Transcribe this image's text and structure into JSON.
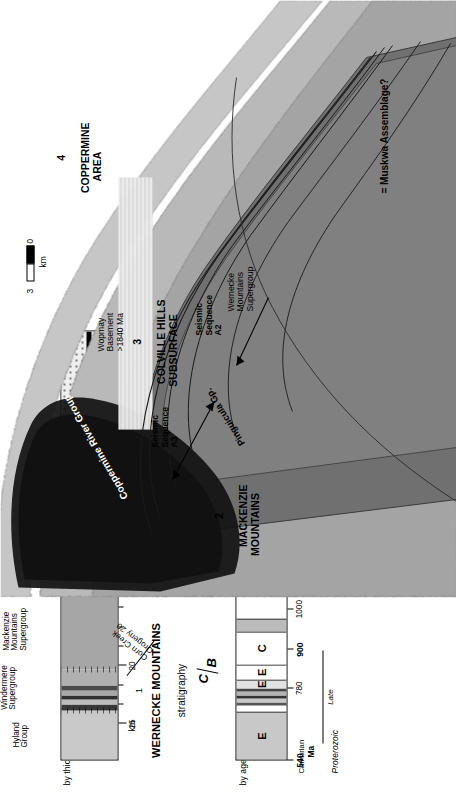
{
  "figure": {
    "kind": "geological-cross-section",
    "orientation": "rotated-90-ccw"
  },
  "panel1": {
    "number": "1",
    "title": "WERNECKE MOUNTAINS",
    "subtitle": "stratigraphy",
    "age_column_label": "by age",
    "thickness_column_label": "by thickness",
    "age_axis": {
      "unit": "Ma",
      "ticks": [
        {
          "label": "540",
          "bold": true,
          "pos": 0.0
        },
        {
          "label": "780",
          "bold": false,
          "pos": 0.168
        },
        {
          "label": "900",
          "bold": true,
          "pos": 0.258
        },
        {
          "label": "1000",
          "bold": false,
          "pos": 0.352
        },
        {
          "label": "1100",
          "bold": false,
          "pos": 0.443
        },
        {
          "label": "1200",
          "bold": false,
          "pos": 0.533
        },
        {
          "label": "1270",
          "bold": false,
          "pos": 0.594
        },
        {
          "label": "1380",
          "bold": false,
          "pos": 0.676
        },
        {
          "label": "1600",
          "bold": true,
          "pos": 0.84
        },
        {
          "label": "1710",
          "bold": false,
          "pos": 0.932
        }
      ],
      "ma_suffix": "Ma",
      "cambrian_label": "Cambrian",
      "eras": [
        {
          "label": "Late",
          "start": 0.04,
          "end": 0.255
        },
        {
          "label": "Middle",
          "start": 0.49,
          "end": 0.7
        },
        {
          "label": "Early",
          "start": 0.905,
          "end": 1.0
        }
      ],
      "system_label": "Proterozoic"
    },
    "age_cells": [
      {
        "name": "hyland",
        "start": 0.0,
        "end": 0.112,
        "fill": "#c8c8c8",
        "letter": "E"
      },
      {
        "name": "windermere-upper",
        "start": 0.112,
        "end": 0.125,
        "fill": "#ffffff",
        "letter": ""
      },
      {
        "name": "windermere-a",
        "start": 0.125,
        "end": 0.134,
        "fill": "#555555",
        "letter": ""
      },
      {
        "name": "windermere-b",
        "start": 0.134,
        "end": 0.143,
        "fill": "#c8c8c8",
        "letter": ""
      },
      {
        "name": "windermere-c",
        "start": 0.143,
        "end": 0.15,
        "fill": "#333333",
        "letter": ""
      },
      {
        "name": "windermere-d",
        "start": 0.15,
        "end": 0.158,
        "fill": "#b4b4b4",
        "letter": ""
      },
      {
        "name": "windermere-e",
        "start": 0.158,
        "end": 0.166,
        "fill": "#444444",
        "letter": ""
      },
      {
        "name": "windermere-f",
        "start": 0.166,
        "end": 0.188,
        "fill": "#e2e2e2",
        "letter": "E"
      },
      {
        "name": "gap-780",
        "start": 0.188,
        "end": 0.222,
        "fill": "#ffffff",
        "letter": "E"
      },
      {
        "name": "pinguicula-gap",
        "start": 0.222,
        "end": 0.3,
        "fill": "#ffffff",
        "letter": "C"
      },
      {
        "name": "pinguicula-a",
        "start": 0.3,
        "end": 0.33,
        "fill": "#bbbbbb",
        "letter": ""
      },
      {
        "name": "mackenzie-mtns",
        "start": 0.33,
        "end": 0.64,
        "fill": "#ffffff",
        "letter": "E"
      },
      {
        "name": "unit-1380",
        "start": 0.64,
        "end": 0.705,
        "fill": "#606060",
        "letter": "E"
      },
      {
        "name": "gap-1600",
        "start": 0.705,
        "end": 0.905,
        "fill": "#ffffff",
        "letter": "C"
      },
      {
        "name": "wernecke-sg-1",
        "start": 0.905,
        "end": 0.945,
        "fill": "#ffffff",
        "letter": "E"
      },
      {
        "name": "wernecke-sg-2",
        "start": 0.945,
        "end": 1.0,
        "fill": "#ededed",
        "letter": "E"
      }
    ],
    "thickness_axis": {
      "unit": "km",
      "unit_label": "km",
      "ticks": [
        {
          "label": "25",
          "pos": 0.085,
          "major": true
        },
        {
          "label": "",
          "pos": 0.13,
          "major": false
        },
        {
          "label": "",
          "pos": 0.175,
          "major": false
        },
        {
          "label": "20",
          "pos": 0.22,
          "major": true
        },
        {
          "label": "",
          "pos": 0.265,
          "major": false
        },
        {
          "label": "",
          "pos": 0.31,
          "major": false
        },
        {
          "label": "",
          "pos": 0.355,
          "major": false
        },
        {
          "label": "15",
          "pos": 0.4,
          "major": true
        },
        {
          "label": "",
          "pos": 0.445,
          "major": false
        },
        {
          "label": "",
          "pos": 0.49,
          "major": false
        },
        {
          "label": "",
          "pos": 0.535,
          "major": false
        },
        {
          "label": "10",
          "pos": 0.58,
          "major": true
        },
        {
          "label": "",
          "pos": 0.625,
          "major": false
        },
        {
          "label": "",
          "pos": 0.67,
          "major": false
        },
        {
          "label": "",
          "pos": 0.715,
          "major": false
        },
        {
          "label": "5",
          "pos": 0.76,
          "major": true
        },
        {
          "label": "",
          "pos": 0.805,
          "major": false
        },
        {
          "label": "",
          "pos": 0.85,
          "major": false
        },
        {
          "label": "",
          "pos": 0.895,
          "major": false
        },
        {
          "label": "0",
          "pos": 0.955,
          "major": true
        }
      ]
    },
    "thickness_cells": [
      {
        "name": "hyland-group",
        "start": 0.0,
        "end": 0.115,
        "fill": "#c9c9c9"
      },
      {
        "name": "windermere-band-1",
        "start": 0.115,
        "end": 0.128,
        "fill": "#3a3a3a"
      },
      {
        "name": "windermere-band-2",
        "start": 0.128,
        "end": 0.14,
        "fill": "#bdbdbd"
      },
      {
        "name": "windermere-band-3",
        "start": 0.14,
        "end": 0.15,
        "fill": "#2e2e2e"
      },
      {
        "name": "windermere-band-4",
        "start": 0.15,
        "end": 0.162,
        "fill": "#a8a8a8"
      },
      {
        "name": "windermere-band-5",
        "start": 0.162,
        "end": 0.172,
        "fill": "#4a4a4a"
      },
      {
        "name": "windermere-supergroup",
        "start": 0.172,
        "end": 0.21,
        "fill": "#b0b0b0"
      },
      {
        "name": "mackenzie-mtns-supergroup",
        "start": 0.21,
        "end": 0.43,
        "fill": "#a6a6a6"
      },
      {
        "name": "pinguicula-group",
        "start": 0.43,
        "end": 0.57,
        "fill": "#6e6e6e"
      },
      {
        "name": "wernecke-breccia-zone",
        "start": 0.57,
        "end": 0.7,
        "fill": "#7a7a7a"
      },
      {
        "name": "wernecke-supergroup-upper",
        "start": 0.7,
        "end": 0.84,
        "fill": "#e8e8e8"
      },
      {
        "name": "wernecke-supergroup-lower",
        "start": 0.84,
        "end": 1.0,
        "fill": "#f0f0f0"
      }
    ],
    "group_labels": [
      {
        "name": "hyland-group",
        "text": "Hyland\nGroup",
        "x": 0.03,
        "y": 12
      },
      {
        "name": "windermere-supergroup",
        "text": "Windermere\nSupergroup",
        "x": 0.118,
        "y": 0
      },
      {
        "name": "mackenzie-mountains-supergroup",
        "text": "Mackenzie\nMountains\nSupergroup",
        "x": 0.255,
        "y": 2
      },
      {
        "name": "pinguicula-group",
        "text": "Pinguicula\nGroup",
        "x": 0.455,
        "y": 4
      },
      {
        "name": "wernecke-supergroup",
        "text": "Wernecke\nSupergroup",
        "x": 0.705,
        "y": 18
      }
    ],
    "annotations": {
      "corn_creek_orogeny": "Corn Creek\nOrogeny 20",
      "racklan_orogeny": "Racklan Orogeny",
      "wernecke_breccia": "Wernecke\nBreccia",
      "seq_c_upper": "C",
      "seq_b_upper": "B",
      "seq_b_mid": "B",
      "seq_a_mid": "A"
    }
  },
  "cross_section": {
    "sections": [
      {
        "num": "2",
        "title": "MACKENZIE\nMOUNTAINS"
      },
      {
        "num": "3",
        "title": "COLVILLE HILLS\nSUBSURFACE"
      },
      {
        "num": "4",
        "title": "COPPERMINE\nAREA"
      }
    ],
    "labels": [
      {
        "name": "coppermine-river-group",
        "text": "Coppermine River Group",
        "white": true
      },
      {
        "name": "wopmay-basement",
        "text": "Wopmay\nBasement\n>1840 Ma",
        "white": false
      },
      {
        "name": "pinguicula-gp",
        "text": "Pinguicula Gp.",
        "white": false
      },
      {
        "name": "wernecke-mountains-supergroup",
        "text": "Wernecke\nMountains\nSupergroup",
        "white": false
      },
      {
        "name": "seismic-sequence-a3",
        "text": "Seismic\nSequence\nA3",
        "white": false
      },
      {
        "name": "seismic-sequence-a2",
        "text": "Seismic\nSequence\nA2",
        "white": false
      },
      {
        "name": "muskwa-assemblage",
        "text": "= Muskwa Assemblage?",
        "white": false
      }
    ],
    "scale_bar": {
      "top_label": "3",
      "bottom_label": "0",
      "unit": "km"
    }
  }
}
